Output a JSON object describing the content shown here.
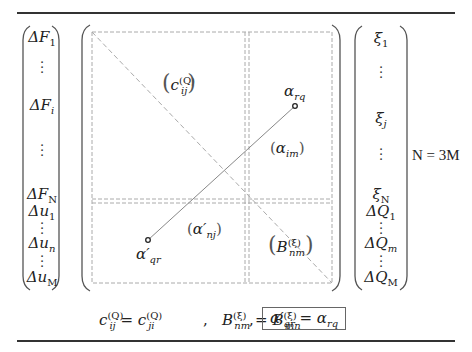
{
  "left_vector": {
    "items": [
      {
        "base": "ΔF",
        "sub": "1"
      },
      {
        "dots": "⋮"
      },
      {
        "base": "ΔF",
        "sub": "i"
      },
      {
        "dots": "⋮"
      },
      {
        "base": "ΔF",
        "sub": "N"
      },
      {
        "base": "Δu",
        "sub": "1"
      },
      {
        "dots": "⋮"
      },
      {
        "base": "Δu",
        "sub": "n"
      },
      {
        "dots": "⋮"
      },
      {
        "base": "Δu",
        "sub": "M"
      }
    ]
  },
  "matrix": {
    "block_top_left": {
      "base": "c",
      "sub": "ij",
      "sup": "(Q)"
    },
    "block_top_right": {
      "base": "α",
      "sub": "im"
    },
    "block_bottom_left": {
      "base": "α′",
      "sub": "nj"
    },
    "block_bottom_right": {
      "base": "B",
      "sub": "nm",
      "sup": "(ξ)"
    },
    "point_upper": {
      "base": "α",
      "sub": "rq"
    },
    "point_lower": {
      "base": "α′",
      "sub": "qr"
    },
    "colors": {
      "dashed": "#aaaaaa",
      "solid_line": "#888888",
      "bracket": "#555555"
    }
  },
  "right_vector": {
    "items": [
      {
        "base": "ξ",
        "sub": "1"
      },
      {
        "dots": "⋮"
      },
      {
        "base": "ξ",
        "sub": "j"
      },
      {
        "dots": "⋮"
      },
      {
        "base": "ξ",
        "sub": "N"
      },
      {
        "base": "ΔQ",
        "sub": "1"
      },
      {
        "dots": "⋮"
      },
      {
        "base": "ΔQ",
        "sub": "m"
      },
      {
        "dots": "⋮"
      },
      {
        "base": "ΔQ",
        "sub": "M"
      }
    ]
  },
  "relation": {
    "text": "N = 3M"
  },
  "symmetry_equations": {
    "eq1": {
      "lhs_base": "c",
      "lhs_sub": "ij",
      "lhs_sup": "(Q)",
      "eq": " = ",
      "rhs_base": "c",
      "rhs_sub": "ji",
      "rhs_sup": "(Q)"
    },
    "sep1": ",",
    "eq2": {
      "lhs_base": "B",
      "lhs_sub": "nm",
      "lhs_sup": "(ξ)",
      "eq": " = ",
      "rhs_base": "B",
      "rhs_sub": "mn",
      "rhs_sup": "(ξ)"
    },
    "sep2": ",",
    "eq3": {
      "lhs_base": "α′",
      "lhs_sub": "qr",
      "eq": " = ",
      "rhs_base": "α",
      "rhs_sub": "rq"
    }
  }
}
